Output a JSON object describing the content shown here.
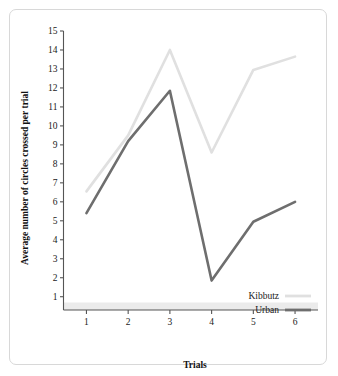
{
  "chart_data": {
    "type": "line",
    "title": "",
    "xlabel": "Trials",
    "ylabel": "Average number of circles crossed per trial",
    "categories": [
      "1",
      "2",
      "3",
      "4",
      "5",
      "6"
    ],
    "x": [
      1,
      2,
      3,
      4,
      5,
      6
    ],
    "xlim": [
      0.45,
      6.55
    ],
    "ylim": [
      0.3,
      15
    ],
    "yticks": [
      "1",
      "2",
      "3",
      "4",
      "5",
      "6",
      "7",
      "8",
      "9",
      "10",
      "11",
      "12",
      "13",
      "14",
      "15"
    ],
    "ytick_values": [
      1,
      2,
      3,
      4,
      5,
      6,
      7,
      8,
      9,
      10,
      11,
      12,
      13,
      14,
      15
    ],
    "grid": false,
    "legend_position": "bottom-right",
    "series": [
      {
        "name": "Kibbutz",
        "values": [
          6.55,
          9.5,
          14.0,
          8.6,
          12.95,
          13.65
        ],
        "color": "#e0e0e0",
        "width": 2.6
      },
      {
        "name": "Urban",
        "values": [
          5.4,
          9.2,
          11.85,
          1.85,
          4.95,
          6.0
        ],
        "color": "#6e6e6e",
        "width": 2.6
      }
    ]
  },
  "axes": {
    "x_axis_label": "Trials",
    "y_axis_label": "Average number of circles crossed per trial",
    "axis_color": "#555555",
    "baseline_band_color": "#ebebeb"
  },
  "legend": {
    "entries": [
      {
        "label": "Kibbutz",
        "color": "#e0e0e0"
      },
      {
        "label": "Urban",
        "color": "#6e6e6e"
      }
    ]
  },
  "frame": {
    "border_color": "#d8d8d8",
    "background": "#ffffff"
  }
}
